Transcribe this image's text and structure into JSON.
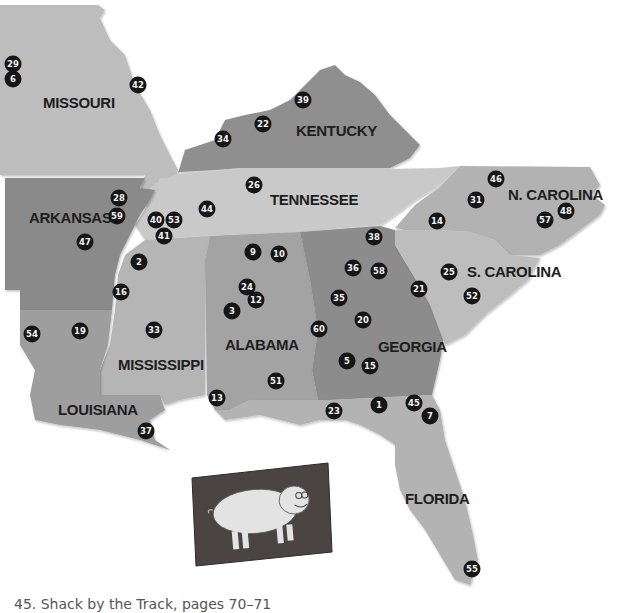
{
  "map": {
    "colors": {
      "background": "#ffffff",
      "missouri": "#bdbdbd",
      "kentucky": "#8f8f8f",
      "tennessee": "#c9c9c9",
      "arkansas": "#8a8a8a",
      "mississippi": "#b5b5b5",
      "alabama": "#a3a3a3",
      "georgia": "#8c8c8c",
      "north_carolina": "#b2b2b2",
      "south_carolina": "#bdbdbd",
      "louisiana": "#9e9e9e",
      "florida": "#b3b3b3",
      "marker_fill": "#161616",
      "marker_text": "#f2f2f2"
    },
    "states": [
      {
        "id": "missouri",
        "label": "MISSOURI"
      },
      {
        "id": "kentucky",
        "label": "KENTUCKY"
      },
      {
        "id": "tennessee",
        "label": "TENNESSEE"
      },
      {
        "id": "arkansas",
        "label": "ARKANSAS"
      },
      {
        "id": "mississippi",
        "label": "MISSISSIPPI"
      },
      {
        "id": "alabama",
        "label": "ALABAMA"
      },
      {
        "id": "georgia",
        "label": "GEORGIA"
      },
      {
        "id": "north_carolina",
        "label": "N. CAROLINA"
      },
      {
        "id": "south_carolina",
        "label": "S. CAROLINA"
      },
      {
        "id": "louisiana",
        "label": "LOUISIANA"
      },
      {
        "id": "florida",
        "label": "FLORIDA"
      }
    ],
    "markers": [
      {
        "n": "29"
      },
      {
        "n": "6"
      },
      {
        "n": "42"
      },
      {
        "n": "39"
      },
      {
        "n": "22"
      },
      {
        "n": "34"
      },
      {
        "n": "26"
      },
      {
        "n": "44"
      },
      {
        "n": "46"
      },
      {
        "n": "31"
      },
      {
        "n": "57"
      },
      {
        "n": "48"
      },
      {
        "n": "14"
      },
      {
        "n": "28"
      },
      {
        "n": "59"
      },
      {
        "n": "47"
      },
      {
        "n": "40"
      },
      {
        "n": "53"
      },
      {
        "n": "41"
      },
      {
        "n": "2"
      },
      {
        "n": "16"
      },
      {
        "n": "9"
      },
      {
        "n": "10"
      },
      {
        "n": "24"
      },
      {
        "n": "12"
      },
      {
        "n": "3"
      },
      {
        "n": "38"
      },
      {
        "n": "36"
      },
      {
        "n": "58"
      },
      {
        "n": "35"
      },
      {
        "n": "21"
      },
      {
        "n": "25"
      },
      {
        "n": "52"
      },
      {
        "n": "20"
      },
      {
        "n": "60"
      },
      {
        "n": "5"
      },
      {
        "n": "15"
      },
      {
        "n": "54"
      },
      {
        "n": "19"
      },
      {
        "n": "33"
      },
      {
        "n": "51"
      },
      {
        "n": "13"
      },
      {
        "n": "23"
      },
      {
        "n": "1"
      },
      {
        "n": "45"
      },
      {
        "n": "7"
      },
      {
        "n": "37"
      },
      {
        "n": "55"
      }
    ]
  },
  "inset_image": {
    "subject": "pig-painting"
  },
  "caption": "45. Shack by the Track, pages 70–71"
}
